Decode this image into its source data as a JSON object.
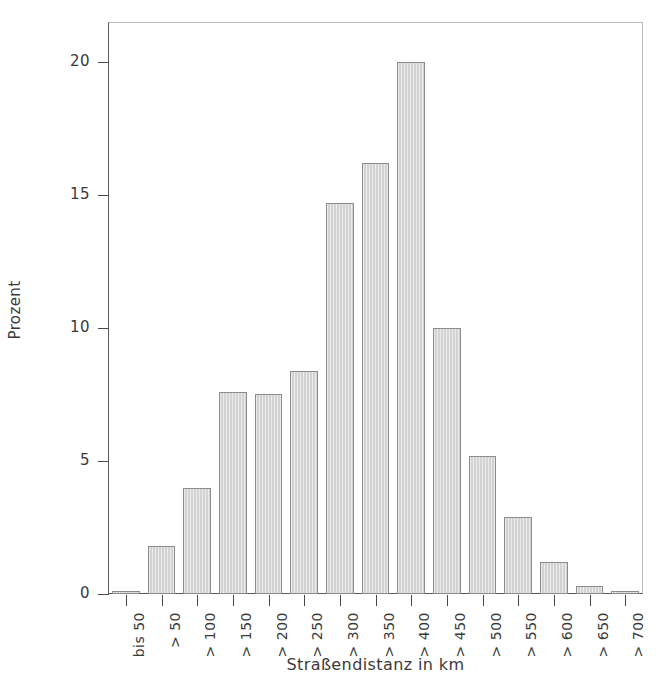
{
  "chart_data": {
    "type": "bar",
    "title": "",
    "xlabel": "Straßendistanz in km",
    "ylabel": "Prozent",
    "categories": [
      "bis 50",
      "> 50",
      "> 100",
      "> 150",
      "> 200",
      "> 250",
      "> 300",
      "> 350",
      "> 400",
      "> 450",
      "> 500",
      "> 550",
      "> 600",
      "> 650",
      "> 700"
    ],
    "values": [
      0.1,
      1.8,
      4.0,
      7.6,
      7.5,
      8.4,
      14.7,
      16.2,
      20.0,
      10.0,
      5.2,
      2.9,
      1.2,
      0.3,
      0.1
    ],
    "ylim": [
      0,
      21.5
    ],
    "yticks": [
      0,
      5,
      10,
      15,
      20
    ],
    "ytick_labels": [
      "0",
      "5",
      "10",
      "15",
      "20"
    ],
    "grid": false,
    "legend": null,
    "bar_fill": "#d3d3d3",
    "bar_border": "#8c8c8c",
    "axis_color": "#4a4a4a"
  }
}
